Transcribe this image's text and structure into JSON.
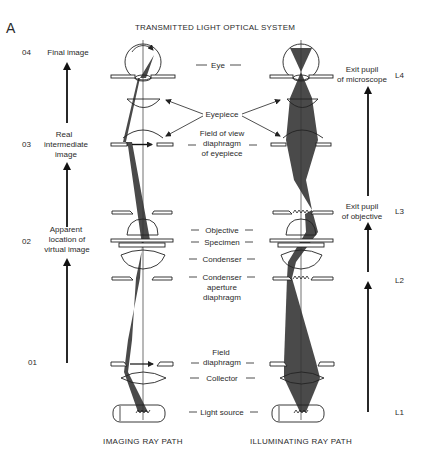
{
  "panel_label": "A",
  "title": "TRANSMITTED LIGHT OPTICAL SYSTEM",
  "left_column": {
    "levels": [
      {
        "id": "04",
        "label_lines": [
          "Final image"
        ]
      },
      {
        "id": "03",
        "label_lines": [
          "Real",
          "intermediate",
          "image"
        ]
      },
      {
        "id": "02",
        "label_lines": [
          "Apparent",
          "location of",
          "virtual image"
        ]
      },
      {
        "id": "01",
        "label_lines": []
      }
    ]
  },
  "center_labels": {
    "eye": "Eye",
    "eyepiece": "Eyepiece",
    "fov_diaphragm": [
      "Field of view",
      "diaphragm",
      "of eyepiece"
    ],
    "objective": "Objective",
    "specimen": "Specimen",
    "condenser": "Condenser",
    "condenser_aperture": [
      "Condenser",
      "aperture",
      "diaphragm"
    ],
    "field_diaphragm": [
      "Field",
      "diaphragm"
    ],
    "collector": "Collector",
    "light_source": "Light source"
  },
  "right_column": {
    "levels": [
      {
        "id": "L4",
        "label_lines": [
          "Exit pupil",
          "of microscope"
        ]
      },
      {
        "id": "L3",
        "label_lines": [
          "Exit pupil",
          "of objective"
        ]
      },
      {
        "id": "L2",
        "label_lines": []
      },
      {
        "id": "L1",
        "label_lines": []
      }
    ]
  },
  "captions": {
    "left": "IMAGING RAY PATH",
    "right": "ILLUMINATING RAY PATH"
  },
  "colors": {
    "beam": "#4a4a4a",
    "line": "#222222",
    "background": "#ffffff"
  }
}
